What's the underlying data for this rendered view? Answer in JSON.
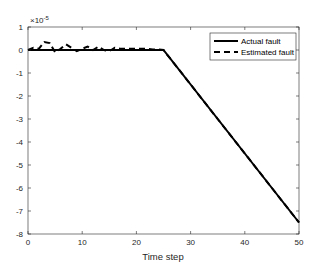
{
  "chart_data": {
    "type": "line",
    "title": "",
    "xlabel": "Time step",
    "ylabel": "",
    "y_exponent_label": "×10",
    "y_exponent": "-5",
    "xlim": [
      0,
      50
    ],
    "ylim": [
      -8,
      1
    ],
    "x_ticks": [
      0,
      10,
      20,
      30,
      40,
      50
    ],
    "y_ticks": [
      1,
      0,
      -1,
      -2,
      -3,
      -4,
      -5,
      -6,
      -7,
      -8
    ],
    "grid": false,
    "legend_position": "upper right",
    "series": [
      {
        "name": "Actual fault",
        "style": "solid",
        "x": [
          0,
          25,
          50
        ],
        "values": [
          0,
          0,
          -7.5
        ]
      },
      {
        "name": "Estimated fault",
        "style": "dashed",
        "x": [
          0,
          1,
          2,
          3,
          4,
          5,
          6,
          7,
          8,
          9,
          10,
          11,
          12,
          13,
          14,
          15,
          16,
          17,
          18,
          19,
          20,
          21,
          22,
          23,
          24,
          25,
          30,
          35,
          40,
          45,
          50
        ],
        "values": [
          0,
          0.1,
          0.05,
          0.35,
          0.3,
          -0.1,
          0.05,
          0.25,
          0.1,
          -0.05,
          0.05,
          0.15,
          0.0,
          0.15,
          0.0,
          -0.05,
          0.1,
          0.05,
          0.05,
          0.05,
          0.05,
          0.05,
          0.05,
          0.02,
          0.02,
          0.0,
          -1.5,
          -3.0,
          -4.5,
          -6.0,
          -7.5
        ]
      }
    ]
  }
}
